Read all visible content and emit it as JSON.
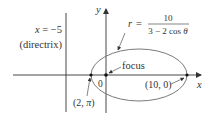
{
  "figure": {
    "type": "polar conic (ellipse) diagram",
    "equation": {
      "lhs": "r =",
      "numerator": "10",
      "denominator": "3 − 2 cos θ"
    },
    "directrix": {
      "equation": "x = −5",
      "label": "(directrix)"
    },
    "axes": {
      "x_label": "x",
      "y_label": "y",
      "origin_label": "0"
    },
    "annotations": {
      "focus": "focus",
      "right_vertex": "(10, 0)",
      "left_vertex": "(2, π)"
    },
    "colors": {
      "line": "#333333",
      "ellipse": "#7a7a7a",
      "text": "#333333",
      "background": "#ffffff"
    }
  }
}
